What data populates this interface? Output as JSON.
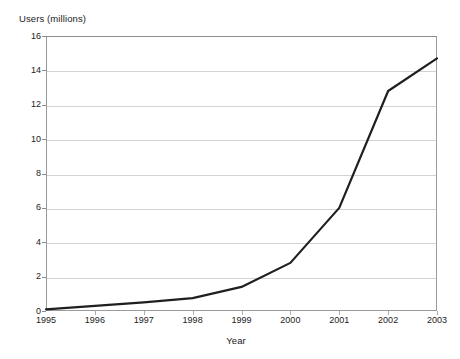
{
  "chart_data": {
    "type": "line",
    "title": "",
    "xlabel": "Year",
    "ylabel": "Users (millions)",
    "categories": [
      "1995",
      "1996",
      "1997",
      "1998",
      "1999",
      "2000",
      "2001",
      "2002",
      "2003"
    ],
    "x": [
      1995,
      1996,
      1997,
      1998,
      1999,
      2000,
      2001,
      2002,
      2003
    ],
    "values": [
      0.1,
      0.3,
      0.5,
      0.75,
      1.4,
      2.8,
      6.0,
      12.8,
      14.7
    ],
    "series": [
      {
        "name": "Users",
        "values": [
          0.1,
          0.3,
          0.5,
          0.75,
          1.4,
          2.8,
          6.0,
          12.8,
          14.7
        ]
      }
    ],
    "ylim": [
      0,
      16
    ],
    "yticks": [
      0,
      2,
      4,
      6,
      8,
      10,
      12,
      14,
      16
    ],
    "ytick_labels": [
      "0",
      "2",
      "4",
      "6",
      "8",
      "10",
      "12",
      "14",
      "16"
    ],
    "xlim": [
      1995,
      2003
    ],
    "grid": "horizontal",
    "legend": "none",
    "line_color": "#1f1f1f",
    "line_width": 2.2,
    "grid_color": "#d3d3d3",
    "axis_color": "#8c8c8c",
    "background_color": "#ffffff"
  }
}
